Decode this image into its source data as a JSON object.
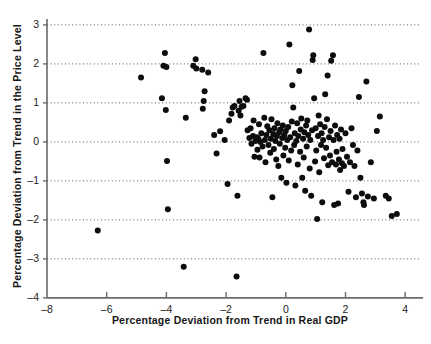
{
  "chart_data": {
    "type": "scatter",
    "title": "",
    "xlabel": "Percentage Deviation from Trend in Real GDP",
    "ylabel": "Percentage Deviation from Trend in the Price Level",
    "xlim": [
      -8,
      4.6
    ],
    "ylim": [
      -4,
      3.1
    ],
    "xticks": [
      -8,
      -6,
      -4,
      -2,
      0,
      2,
      4
    ],
    "xtick_labels": [
      "–8",
      "–6",
      "–4",
      "–2",
      "0",
      "2",
      "4"
    ],
    "yticks": [
      -4,
      -3,
      -2,
      -1,
      0,
      1,
      2,
      3
    ],
    "ytick_labels": [
      "–4",
      "–3",
      "–2",
      "–1",
      "0",
      "1",
      "2",
      "3"
    ],
    "grid": "horizontal-dotted",
    "grid_color": "#555555",
    "axis_color": "#6b6b6b",
    "marker_color": "#0d0d0d",
    "marker_size": 3.0,
    "legend": null,
    "points": [
      [
        -6.3,
        -2.27
      ],
      [
        -4.85,
        1.65
      ],
      [
        -4.15,
        1.12
      ],
      [
        -4.1,
        1.95
      ],
      [
        -4.05,
        2.28
      ],
      [
        -4.0,
        1.92
      ],
      [
        -4.02,
        0.82
      ],
      [
        -3.98,
        -0.49
      ],
      [
        -3.95,
        -1.73
      ],
      [
        -3.42,
        -3.2
      ],
      [
        -3.35,
        0.62
      ],
      [
        -3.1,
        1.95
      ],
      [
        -3.02,
        2.12
      ],
      [
        -3.0,
        1.88
      ],
      [
        -2.8,
        1.85
      ],
      [
        -2.78,
        0.85
      ],
      [
        -2.75,
        1.05
      ],
      [
        -2.72,
        1.3
      ],
      [
        -2.6,
        1.78
      ],
      [
        -2.4,
        0.18
      ],
      [
        -2.32,
        -0.3
      ],
      [
        -2.2,
        0.27
      ],
      [
        -2.05,
        0.05
      ],
      [
        -1.95,
        -1.08
      ],
      [
        -1.9,
        0.55
      ],
      [
        -1.82,
        0.72
      ],
      [
        -1.78,
        0.88
      ],
      [
        -1.72,
        0.92
      ],
      [
        -1.65,
        -3.45
      ],
      [
        -1.62,
        -1.38
      ],
      [
        -1.58,
        0.8
      ],
      [
        -1.55,
        1.05
      ],
      [
        -1.52,
        0.68
      ],
      [
        -1.48,
        0.9
      ],
      [
        -1.42,
        0.92
      ],
      [
        -1.35,
        1.12
      ],
      [
        -1.3,
        1.08
      ],
      [
        -1.28,
        0.3
      ],
      [
        -1.22,
        0.1
      ],
      [
        -1.18,
        0.35
      ],
      [
        -1.15,
        -0.05
      ],
      [
        -1.1,
        0.15
      ],
      [
        -1.08,
        0.55
      ],
      [
        -1.05,
        -0.38
      ],
      [
        -1.02,
        0.02
      ],
      [
        -0.98,
        0.12
      ],
      [
        -0.95,
        -0.2
      ],
      [
        -0.92,
        0.08
      ],
      [
        -0.9,
        0.45
      ],
      [
        -0.88,
        -0.4
      ],
      [
        -0.85,
        0.0
      ],
      [
        -0.82,
        0.22
      ],
      [
        -0.78,
        -0.12
      ],
      [
        -0.75,
        2.28
      ],
      [
        -0.72,
        0.62
      ],
      [
        -0.7,
        0.05
      ],
      [
        -0.68,
        -0.52
      ],
      [
        -0.65,
        0.18
      ],
      [
        -0.62,
        0.4
      ],
      [
        -0.58,
        -0.08
      ],
      [
        -0.55,
        0.3
      ],
      [
        -0.52,
        -0.28
      ],
      [
        -0.5,
        0.08
      ],
      [
        -0.48,
        0.58
      ],
      [
        -0.45,
        -1.42
      ],
      [
        -0.42,
        0.2
      ],
      [
        -0.4,
        -0.18
      ],
      [
        -0.38,
        0.35
      ],
      [
        -0.35,
        0.02
      ],
      [
        -0.32,
        -0.45
      ],
      [
        -0.3,
        0.15
      ],
      [
        -0.28,
        0.48
      ],
      [
        -0.25,
        -0.62
      ],
      [
        -0.22,
        0.25
      ],
      [
        -0.2,
        -0.05
      ],
      [
        -0.18,
        0.32
      ],
      [
        -0.15,
        -0.92
      ],
      [
        -0.12,
        0.1
      ],
      [
        -0.1,
        0.42
      ],
      [
        -0.08,
        -0.35
      ],
      [
        -0.05,
        0.18
      ],
      [
        -0.02,
        -0.15
      ],
      [
        0.0,
        0.28
      ],
      [
        0.02,
        -1.05
      ],
      [
        0.05,
        0.05
      ],
      [
        0.08,
        0.38
      ],
      [
        0.1,
        -0.48
      ],
      [
        0.12,
        2.5
      ],
      [
        0.15,
        0.12
      ],
      [
        0.18,
        -0.22
      ],
      [
        0.2,
        0.52
      ],
      [
        0.22,
        1.45
      ],
      [
        0.25,
        0.88
      ],
      [
        0.28,
        -0.08
      ],
      [
        0.3,
        0.22
      ],
      [
        0.32,
        -1.12
      ],
      [
        0.35,
        0.02
      ],
      [
        0.38,
        0.48
      ],
      [
        0.4,
        -0.58
      ],
      [
        0.42,
        0.15
      ],
      [
        0.45,
        1.82
      ],
      [
        0.48,
        -0.25
      ],
      [
        0.5,
        0.32
      ],
      [
        0.52,
        0.6
      ],
      [
        0.55,
        -0.92
      ],
      [
        0.58,
        0.08
      ],
      [
        0.6,
        -0.4
      ],
      [
        0.62,
        0.25
      ],
      [
        0.65,
        -1.25
      ],
      [
        0.68,
        0.42
      ],
      [
        0.7,
        -0.12
      ],
      [
        0.72,
        0.55
      ],
      [
        0.75,
        0.18
      ],
      [
        0.78,
        2.88
      ],
      [
        0.8,
        -0.68
      ],
      [
        0.82,
        0.05
      ],
      [
        0.85,
        -1.38
      ],
      [
        0.88,
        0.3
      ],
      [
        0.9,
        2.1
      ],
      [
        0.92,
        2.22
      ],
      [
        0.95,
        1.12
      ],
      [
        0.98,
        -0.5
      ],
      [
        1.0,
        0.35
      ],
      [
        1.02,
        -0.22
      ],
      [
        1.05,
        -1.98
      ],
      [
        1.08,
        0.15
      ],
      [
        1.1,
        0.68
      ],
      [
        1.12,
        -0.78
      ],
      [
        1.15,
        0.45
      ],
      [
        1.18,
        -0.08
      ],
      [
        1.2,
        0.22
      ],
      [
        1.22,
        -1.55
      ],
      [
        1.25,
        0.05
      ],
      [
        1.28,
        -0.42
      ],
      [
        1.3,
        0.38
      ],
      [
        1.32,
        1.22
      ],
      [
        1.35,
        -0.15
      ],
      [
        1.38,
        0.58
      ],
      [
        1.4,
        1.7
      ],
      [
        1.42,
        -0.6
      ],
      [
        1.45,
        0.12
      ],
      [
        1.48,
        -0.35
      ],
      [
        1.5,
        0.28
      ],
      [
        1.52,
        2.08
      ],
      [
        1.55,
        -0.52
      ],
      [
        1.58,
        2.22
      ],
      [
        1.6,
        0.05
      ],
      [
        1.62,
        -1.62
      ],
      [
        1.65,
        0.42
      ],
      [
        1.68,
        -0.58
      ],
      [
        1.7,
        -0.25
      ],
      [
        1.72,
        0.18
      ],
      [
        1.75,
        -1.58
      ],
      [
        1.78,
        -0.45
      ],
      [
        1.8,
        0.08
      ],
      [
        1.82,
        -0.72
      ],
      [
        1.85,
        0.32
      ],
      [
        1.88,
        -0.55
      ],
      [
        1.9,
        -0.18
      ],
      [
        1.95,
        -0.62
      ],
      [
        2.0,
        0.22
      ],
      [
        2.05,
        -0.38
      ],
      [
        2.1,
        -1.28
      ],
      [
        2.15,
        -0.52
      ],
      [
        2.2,
        0.35
      ],
      [
        2.25,
        -0.08
      ],
      [
        2.3,
        -0.62
      ],
      [
        2.35,
        -1.42
      ],
      [
        2.4,
        -0.22
      ],
      [
        2.45,
        1.15
      ],
      [
        2.5,
        -0.92
      ],
      [
        2.55,
        -1.32
      ],
      [
        2.6,
        -1.55
      ],
      [
        2.62,
        -1.62
      ],
      [
        2.7,
        1.55
      ],
      [
        2.75,
        -1.4
      ],
      [
        2.85,
        -0.52
      ],
      [
        2.95,
        -1.45
      ],
      [
        3.05,
        0.28
      ],
      [
        3.15,
        0.65
      ],
      [
        3.35,
        -1.38
      ],
      [
        3.45,
        -1.45
      ],
      [
        3.55,
        -1.9
      ],
      [
        3.72,
        -1.85
      ]
    ]
  }
}
